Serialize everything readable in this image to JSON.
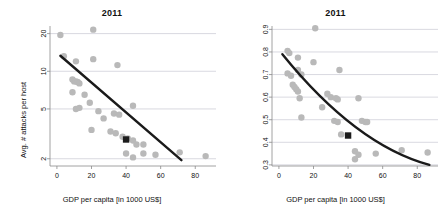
{
  "figure": {
    "background": "#ffffff",
    "dot_color": "#b9b9b9",
    "trend_color": "#1a1a1a",
    "marker_color": "#1c1c1c",
    "grid_color": "#c8c8d2",
    "panel_count": 2
  },
  "chart_data": [
    {
      "type": "scatter",
      "panel": "left",
      "title": "2011",
      "xlabel": "GDP per capita [in 1000 US$]",
      "ylabel": "Avg. # attacks per host",
      "xlim": [
        -4,
        92
      ],
      "ylim": [
        1.75,
        23
      ],
      "yscale": "log",
      "xscale": "linear",
      "xticks": [
        0,
        20,
        40,
        60,
        80
      ],
      "yticks": [
        2,
        5,
        10,
        20
      ],
      "grid": true,
      "legend": "none",
      "points": [
        {
          "x": 2,
          "y": 19.5
        },
        {
          "x": 21,
          "y": 21.5
        },
        {
          "x": 4,
          "y": 13.2
        },
        {
          "x": 11,
          "y": 12.0
        },
        {
          "x": 21,
          "y": 12.5
        },
        {
          "x": 35,
          "y": 11.2
        },
        {
          "x": 9,
          "y": 8.6
        },
        {
          "x": 10,
          "y": 8.3
        },
        {
          "x": 11,
          "y": 8.3
        },
        {
          "x": 12,
          "y": 8.2
        },
        {
          "x": 13,
          "y": 8.0
        },
        {
          "x": 9,
          "y": 6.8
        },
        {
          "x": 16,
          "y": 6.5
        },
        {
          "x": 11,
          "y": 5.0
        },
        {
          "x": 13,
          "y": 5.1
        },
        {
          "x": 19,
          "y": 5.6
        },
        {
          "x": 24,
          "y": 4.8
        },
        {
          "x": 27,
          "y": 4.2
        },
        {
          "x": 33,
          "y": 4.6
        },
        {
          "x": 36,
          "y": 4.5
        },
        {
          "x": 44,
          "y": 5.3
        },
        {
          "x": 20,
          "y": 3.4
        },
        {
          "x": 31,
          "y": 3.3
        },
        {
          "x": 34,
          "y": 3.2
        },
        {
          "x": 38,
          "y": 3.0
        },
        {
          "x": 41,
          "y": 2.9
        },
        {
          "x": 44,
          "y": 2.8
        },
        {
          "x": 46,
          "y": 2.6
        },
        {
          "x": 50,
          "y": 2.6
        },
        {
          "x": 40,
          "y": 2.2
        },
        {
          "x": 44,
          "y": 2.05
        },
        {
          "x": 50,
          "y": 2.2
        },
        {
          "x": 57,
          "y": 2.15
        },
        {
          "x": 71,
          "y": 2.25
        },
        {
          "x": 86,
          "y": 2.1
        }
      ],
      "trendline": {
        "x_start": 2,
        "y_start": 13.3,
        "x_end": 72,
        "y_end": 1.95
      },
      "highlight_marker": {
        "x": 40,
        "y": 2.85,
        "shape": "square"
      }
    },
    {
      "type": "scatter",
      "panel": "right",
      "title": "2011",
      "xlabel": "GDP per capita [in 1000 US$]",
      "ylabel": "% attacked hosts",
      "xlim": [
        -4,
        92
      ],
      "ylim": [
        0.295,
        0.915
      ],
      "yscale": "linear",
      "xscale": "linear",
      "xticks": [
        0,
        20,
        40,
        60,
        80
      ],
      "yticks": [
        0.3,
        0.4,
        0.5,
        0.6,
        0.7,
        0.8,
        0.9
      ],
      "grid": true,
      "legend": "none",
      "points": [
        {
          "x": 21,
          "y": 0.905
        },
        {
          "x": 5,
          "y": 0.805
        },
        {
          "x": 6,
          "y": 0.795
        },
        {
          "x": 11,
          "y": 0.775
        },
        {
          "x": 20,
          "y": 0.755
        },
        {
          "x": 5,
          "y": 0.705
        },
        {
          "x": 7,
          "y": 0.695
        },
        {
          "x": 11,
          "y": 0.72
        },
        {
          "x": 13,
          "y": 0.7
        },
        {
          "x": 35,
          "y": 0.72
        },
        {
          "x": 8,
          "y": 0.655
        },
        {
          "x": 9,
          "y": 0.645
        },
        {
          "x": 10,
          "y": 0.635
        },
        {
          "x": 11,
          "y": 0.625
        },
        {
          "x": 28,
          "y": 0.615
        },
        {
          "x": 30,
          "y": 0.6
        },
        {
          "x": 33,
          "y": 0.595
        },
        {
          "x": 34,
          "y": 0.59
        },
        {
          "x": 46,
          "y": 0.595
        },
        {
          "x": 12,
          "y": 0.595
        },
        {
          "x": 25,
          "y": 0.555
        },
        {
          "x": 13,
          "y": 0.51
        },
        {
          "x": 32,
          "y": 0.495
        },
        {
          "x": 34,
          "y": 0.49
        },
        {
          "x": 48,
          "y": 0.495
        },
        {
          "x": 50,
          "y": 0.49
        },
        {
          "x": 51,
          "y": 0.49
        },
        {
          "x": 36,
          "y": 0.435
        },
        {
          "x": 44,
          "y": 0.36
        },
        {
          "x": 46,
          "y": 0.345
        },
        {
          "x": 44,
          "y": 0.325
        },
        {
          "x": 56,
          "y": 0.35
        },
        {
          "x": 71,
          "y": 0.365
        },
        {
          "x": 86,
          "y": 0.355
        }
      ],
      "trendline": {
        "x_start": 2,
        "y_start": 0.79,
        "x_end": 87,
        "y_end": 0.3,
        "curvature": "convex"
      },
      "highlight_marker": {
        "x": 40,
        "y": 0.43,
        "shape": "square"
      }
    }
  ]
}
